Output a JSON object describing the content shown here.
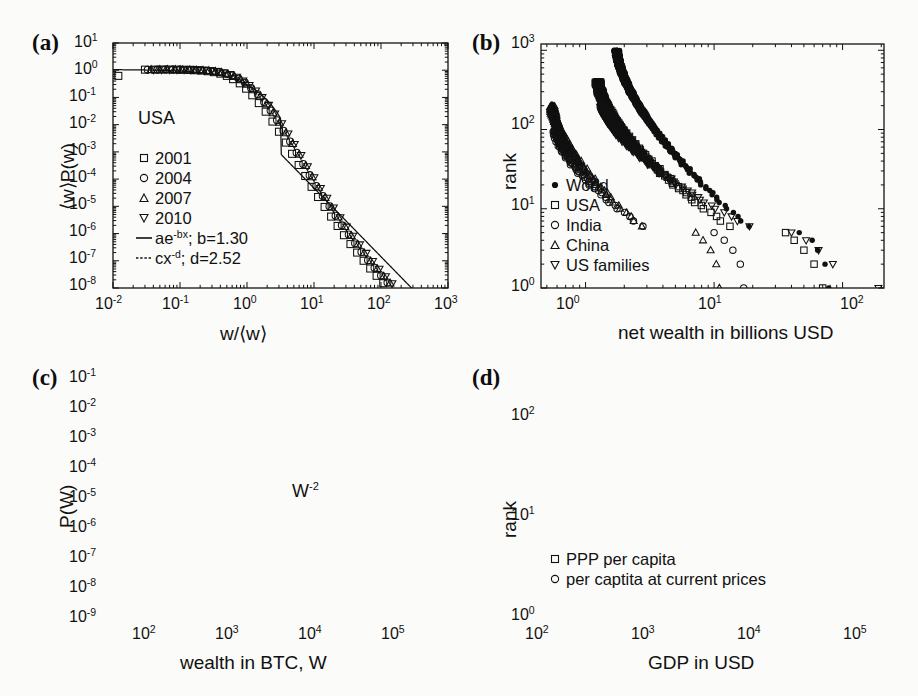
{
  "figure": {
    "background": "#fbfbf9",
    "ink": "#111111",
    "panels": [
      "a",
      "b",
      "c",
      "d"
    ]
  },
  "panel_a": {
    "label": "(a)",
    "xlabel": "w/⟨w⟩",
    "ylabel": "⟨w⟩P(w)",
    "annotation": "USA",
    "xticks": [
      "10-2",
      "10-1",
      "100",
      "101",
      "102",
      "103"
    ],
    "yticks": [
      "101",
      "100",
      "10-1",
      "10-2",
      "10-3",
      "10-4",
      "10-5",
      "10-6",
      "10-7",
      "10-8"
    ],
    "legend": [
      {
        "marker": "square-open",
        "label": "2001"
      },
      {
        "marker": "circle-open",
        "label": "2004"
      },
      {
        "marker": "triangle-up-open",
        "label": "2007"
      },
      {
        "marker": "triangle-down-open",
        "label": "2010"
      },
      {
        "marker": "solid-line",
        "label": "ae-bx; b=1.30"
      },
      {
        "marker": "dashed-line",
        "label": "cx-d; d=2.52"
      }
    ]
  },
  "panel_b": {
    "label": "(b)",
    "xlabel": "net wealth in billions USD",
    "ylabel": "rank",
    "xticks": [
      "100",
      "101",
      "102"
    ],
    "yticks": [
      "103",
      "102",
      "101",
      "100"
    ],
    "legend": [
      {
        "marker": "circle-filled",
        "label": "World"
      },
      {
        "marker": "square-open",
        "label": "USA"
      },
      {
        "marker": "circle-open",
        "label": "India"
      },
      {
        "marker": "triangle-up-open",
        "label": "China"
      },
      {
        "marker": "triangle-down-open",
        "label": "US families"
      }
    ]
  },
  "panel_c": {
    "label": "(c)",
    "xlabel": "wealth in BTC, W",
    "ylabel": "P(W)",
    "annotation": "W-2",
    "xticks": [
      "102",
      "103",
      "104",
      "105"
    ],
    "yticks": [
      "10-1",
      "10-2",
      "10-3",
      "10-4",
      "10-5",
      "10-6",
      "10-7",
      "10-8",
      "10-9"
    ]
  },
  "panel_d": {
    "label": "(d)",
    "xlabel": "GDP in USD",
    "ylabel": "rank",
    "xticks": [
      "102",
      "103",
      "104",
      "105"
    ],
    "yticks": [
      "102",
      "101",
      "100"
    ],
    "legend": [
      {
        "marker": "square-open",
        "label": "PPP per capita"
      },
      {
        "marker": "circle-open",
        "label": "per captita at current prices"
      }
    ]
  },
  "chart_data": [
    {
      "type": "scatter",
      "panel": "a",
      "title": "(a) Scaled wealth distribution, USA",
      "xlabel": "w/<w>",
      "ylabel": "<w>P(w)",
      "xscale": "log",
      "yscale": "log",
      "xlim": [
        0.01,
        1000
      ],
      "ylim": [
        1e-08,
        10
      ],
      "annotation": "USA",
      "grid": false,
      "legend_position": "center-left",
      "fits": [
        {
          "name": "ae^{-bx}",
          "b": 1.3,
          "style": "solid"
        },
        {
          "name": "cx^{-d}",
          "d": 2.52,
          "style": "dashed"
        }
      ],
      "series": [
        {
          "name": "2001",
          "marker": "square-open",
          "x": [
            0.012,
            0.03,
            0.042,
            0.055,
            0.07,
            0.09,
            0.11,
            0.14,
            0.17,
            0.21,
            0.26,
            0.32,
            0.4,
            0.5,
            0.62,
            0.78,
            0.97,
            1.2,
            1.5,
            1.9,
            2.4,
            3.0,
            3.8,
            4.7,
            5.9,
            7.4,
            9.2,
            11.5,
            14.4,
            18,
            22.5,
            28,
            35,
            44,
            55,
            69,
            86,
            108,
            135,
            170,
            210,
            260,
            330,
            410,
            500
          ],
          "y": [
            0.62,
            1.05,
            1.05,
            1.06,
            1.06,
            1.05,
            1.04,
            1.03,
            1.0,
            0.97,
            0.92,
            0.85,
            0.75,
            0.62,
            0.47,
            0.33,
            0.21,
            0.12,
            0.062,
            0.03,
            0.013,
            0.0055,
            0.0022,
            0.00085,
            0.00033,
            0.00013,
            5.2e-05,
            2.2e-05,
            9.5e-06,
            4.2e-06,
            1.9e-06,
            8.7e-07,
            4.1e-07,
            2e-07,
            1e-07,
            5.2e-08,
            2.8e-08,
            1.5e-08,
            8.5e-09,
            5e-09,
            3e-09,
            1.9e-09,
            1.2e-09,
            8e-10,
            6e-10
          ]
        },
        {
          "name": "2004",
          "marker": "circle-open",
          "x": [
            0.033,
            0.046,
            0.06,
            0.078,
            0.1,
            0.13,
            0.16,
            0.2,
            0.25,
            0.31,
            0.38,
            0.48,
            0.6,
            0.75,
            0.93,
            1.15,
            1.45,
            1.8,
            2.25,
            2.8,
            3.5,
            4.4,
            5.5,
            6.9,
            8.6,
            10.8,
            13.5,
            17,
            21,
            26,
            33,
            41,
            51,
            64,
            80,
            100,
            125,
            155,
            195,
            245,
            305,
            380,
            470
          ],
          "y": [
            1.04,
            1.05,
            1.06,
            1.05,
            1.05,
            1.04,
            1.03,
            1.01,
            0.98,
            0.93,
            0.87,
            0.77,
            0.64,
            0.49,
            0.35,
            0.22,
            0.13,
            0.068,
            0.033,
            0.0145,
            0.006,
            0.0024,
            0.00093,
            0.00036,
            0.00014,
            5.6e-05,
            2.4e-05,
            1e-05,
            4.5e-06,
            2e-06,
            9.3e-07,
            4.4e-07,
            2.1e-07,
            1.05e-07,
            5.5e-08,
            2.9e-08,
            1.6e-08,
            9e-09,
            5.2e-09,
            3.2e-09,
            2e-09,
            1.3e-09,
            8.5e-10
          ]
        },
        {
          "name": "2007",
          "marker": "triangle-up-open",
          "x": [
            0.037,
            0.05,
            0.065,
            0.085,
            0.11,
            0.14,
            0.175,
            0.22,
            0.27,
            0.34,
            0.42,
            0.52,
            0.65,
            0.81,
            1.0,
            1.25,
            1.57,
            1.95,
            2.45,
            3.05,
            3.8,
            4.8,
            6.0,
            7.5,
            9.4,
            11.7,
            14.7,
            18.4,
            23,
            29,
            36,
            45,
            56,
            70,
            88,
            110,
            137,
            172,
            215,
            270,
            335,
            420,
            520
          ],
          "y": [
            1.05,
            1.06,
            1.05,
            1.05,
            1.04,
            1.03,
            1.02,
            1.0,
            0.96,
            0.9,
            0.83,
            0.72,
            0.58,
            0.44,
            0.3,
            0.19,
            0.11,
            0.057,
            0.027,
            0.012,
            0.005,
            0.002,
            0.0008,
            0.00031,
            0.00012,
            4.9e-05,
            2.1e-05,
            9.2e-06,
            4e-06,
            1.8e-06,
            8.4e-07,
            4e-07,
            1.95e-07,
            9.8e-08,
            5.1e-08,
            2.7e-08,
            1.5e-08,
            8.4e-09,
            5e-09,
            3.1e-09,
            1.95e-09,
            1.25e-09,
            8.2e-10
          ]
        },
        {
          "name": "2010",
          "marker": "triangle-down-open",
          "x": [
            0.04,
            0.053,
            0.07,
            0.09,
            0.115,
            0.145,
            0.185,
            0.23,
            0.29,
            0.36,
            0.45,
            0.56,
            0.7,
            0.87,
            1.08,
            1.35,
            1.68,
            2.1,
            2.6,
            3.3,
            4.1,
            5.1,
            6.4,
            8.0,
            10,
            12.5,
            15.6,
            19.5,
            24.5,
            30.5,
            38,
            48,
            60,
            75,
            94,
            117,
            146,
            183,
            230,
            285,
            355,
            445,
            550
          ],
          "y": [
            1.05,
            1.05,
            1.06,
            1.05,
            1.04,
            1.03,
            1.02,
            0.99,
            0.95,
            0.89,
            0.81,
            0.7,
            0.56,
            0.41,
            0.28,
            0.175,
            0.1,
            0.052,
            0.025,
            0.011,
            0.0046,
            0.0019,
            0.00075,
            0.00029,
            0.000115,
            4.6e-05,
            2e-05,
            8.8e-06,
            3.9e-06,
            1.75e-06,
            8.1e-07,
            3.9e-07,
            1.9e-07,
            9.5e-08,
            5e-08,
            2.65e-08,
            1.45e-08,
            8.2e-09,
            4.9e-09,
            3e-09,
            1.9e-09,
            1.2e-09,
            8e-10
          ]
        }
      ]
    },
    {
      "type": "scatter",
      "panel": "b",
      "title": "(b) Rank plot of net wealth",
      "xlabel": "net wealth in billions USD",
      "ylabel": "rank",
      "xscale": "log",
      "yscale": "log",
      "xlim": [
        0.45,
        210
      ],
      "ylim": [
        1,
        1200
      ],
      "grid": false,
      "legend_position": "lower-left",
      "series": [
        {
          "name": "World",
          "marker": "circle-filled",
          "n_points": 1000,
          "x_start": 1.75,
          "y_start": 1000,
          "x_end": 73,
          "y_end": 1,
          "tail_x": [
            46,
            58,
            64,
            73,
            78
          ],
          "tail_y": [
            5,
            4,
            3,
            2,
            1
          ]
        },
        {
          "name": "USA",
          "marker": "square-open",
          "n_points": 400,
          "x_start": 1.25,
          "y_start": 400,
          "x_end": 72,
          "y_end": 1,
          "tail_x": [
            36,
            42,
            50,
            60,
            70
          ],
          "tail_y": [
            5,
            4,
            3,
            2,
            1
          ]
        },
        {
          "name": "India",
          "marker": "circle-open",
          "n_points": 100,
          "x_start": 0.58,
          "y_start": 100,
          "x_end": 16,
          "y_end": 1,
          "tail_x": [
            10,
            12,
            14,
            16,
            17
          ],
          "tail_y": [
            5,
            4,
            3,
            2,
            1
          ]
        },
        {
          "name": "China",
          "marker": "triangle-up-open",
          "n_points": 200,
          "x_start": 0.55,
          "y_start": 200,
          "x_end": 11,
          "y_end": 1,
          "tail_x": [
            7.2,
            8.2,
            9.4,
            10.4,
            11
          ],
          "tail_y": [
            5,
            4,
            3,
            2,
            1
          ]
        },
        {
          "name": "US families",
          "marker": "triangle-down-open",
          "n_points": 200,
          "x_start": 1.35,
          "y_start": 200,
          "x_end": 190,
          "y_end": 1,
          "tail_x": [
            40,
            52,
            65,
            84,
            190
          ],
          "tail_y": [
            5,
            4,
            3,
            2,
            1
          ]
        }
      ]
    },
    {
      "type": "scatter",
      "panel": "c",
      "title": "(c) Bitcoin wealth distribution",
      "xlabel": "wealth in BTC, W",
      "ylabel": "P(W)",
      "xscale": "log",
      "yscale": "log",
      "xlim": [
        40,
        200000
      ],
      "ylim": [
        1e-09,
        0.1
      ],
      "annotation": "W^-2",
      "grid": false,
      "fit": {
        "name": "W^{-2}",
        "slope": -2,
        "style": "solid",
        "x": [
          40,
          200000
        ],
        "y": [
          0.045,
          1.5e-09
        ]
      },
      "series": [
        {
          "name": "P(W)",
          "marker": "circle-open",
          "x": [
            55,
            90,
            150,
            200,
            280,
            400,
            570,
            800,
            1000,
            1500,
            2000,
            2800,
            3900,
            5000,
            7500,
            10500,
            17000,
            25000,
            40000,
            55000,
            80000,
            110000,
            160000
          ],
          "y": [
            0.009,
            0.01,
            0.002,
            0.0015,
            0.0005,
            0.00036,
            0.00015,
            0.00011,
            0.000105,
            2.1e-05,
            1.4e-05,
            4.8e-06,
            3.3e-06,
            3.3e-06,
            8.5e-07,
            6.2e-07,
            1.2e-07,
            5e-08,
            8e-08,
            9e-09,
            4.5e-09,
            2.5e-09,
            1.8e-09
          ]
        }
      ]
    },
    {
      "type": "scatter",
      "panel": "d",
      "title": "(d) Rank plot of GDP per capita",
      "xlabel": "GDP in USD",
      "ylabel": "rank",
      "xscale": "log",
      "yscale": "log",
      "xlim": [
        100,
        120000
      ],
      "ylim": [
        1,
        260
      ],
      "grid": false,
      "legend_position": "lower-left",
      "series": [
        {
          "name": "PPP per capita",
          "marker": "square-open",
          "n_points": 190,
          "x_start": 300,
          "y_start": 190,
          "x_end": 78000,
          "y_end": 1,
          "knee_x": 25000,
          "knee_y": 25
        },
        {
          "name": "per captita at current prices",
          "marker": "circle-open",
          "n_points": 190,
          "x_start": 185,
          "y_start": 190,
          "x_end": 85000,
          "y_end": 1,
          "knee_x": 30000,
          "knee_y": 25
        }
      ]
    }
  ]
}
